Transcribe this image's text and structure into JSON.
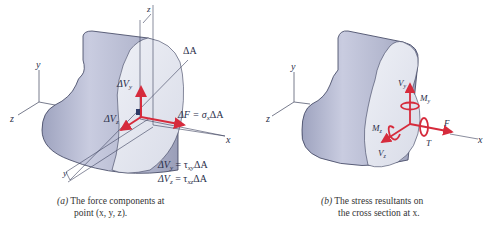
{
  "panel_a": {
    "axis_labels": {
      "y": "y",
      "z": "z",
      "x": "x",
      "z_offset": "z",
      "y_offset": "y"
    },
    "area_label": "ΔA",
    "force_labels": {
      "dVy": "ΔV",
      "dVy_sub": "y",
      "dVz": "ΔV",
      "dVz_sub": "z",
      "dF": "ΔF = σ",
      "dF_sub": "x",
      "dF_tail": "ΔA"
    },
    "equations": [
      {
        "lhs": "ΔV",
        "lhs_sub": "y",
        "mid": " = τ",
        "mid_sub": "xy",
        "rhs": "ΔA"
      },
      {
        "lhs": "ΔV",
        "lhs_sub": "z",
        "mid": " = τ",
        "mid_sub": "xz",
        "rhs": "ΔA"
      }
    ],
    "caption_line1_prefix": "(a)",
    "caption_line1": " The force components at",
    "caption_line2": "point (x, y, z)."
  },
  "panel_b": {
    "axis_labels": {
      "y": "y",
      "z": "z",
      "x": "x"
    },
    "resultant_labels": {
      "Vy": "V",
      "Vy_sub": "y",
      "My": "M",
      "My_sub": "y",
      "Mz": "M",
      "Mz_sub": "z",
      "Vz": "V",
      "Vz_sub": "z",
      "F": "F",
      "T": "T"
    },
    "caption_line1_prefix": "(b)",
    "caption_line1": " The stress resultants on",
    "caption_line2": "the cross section at x."
  },
  "colors": {
    "arrow": "#d62b3c",
    "body_fill": "#c3c7da",
    "face_fill": "#e4e6ee",
    "line": "#3a3f5c"
  }
}
